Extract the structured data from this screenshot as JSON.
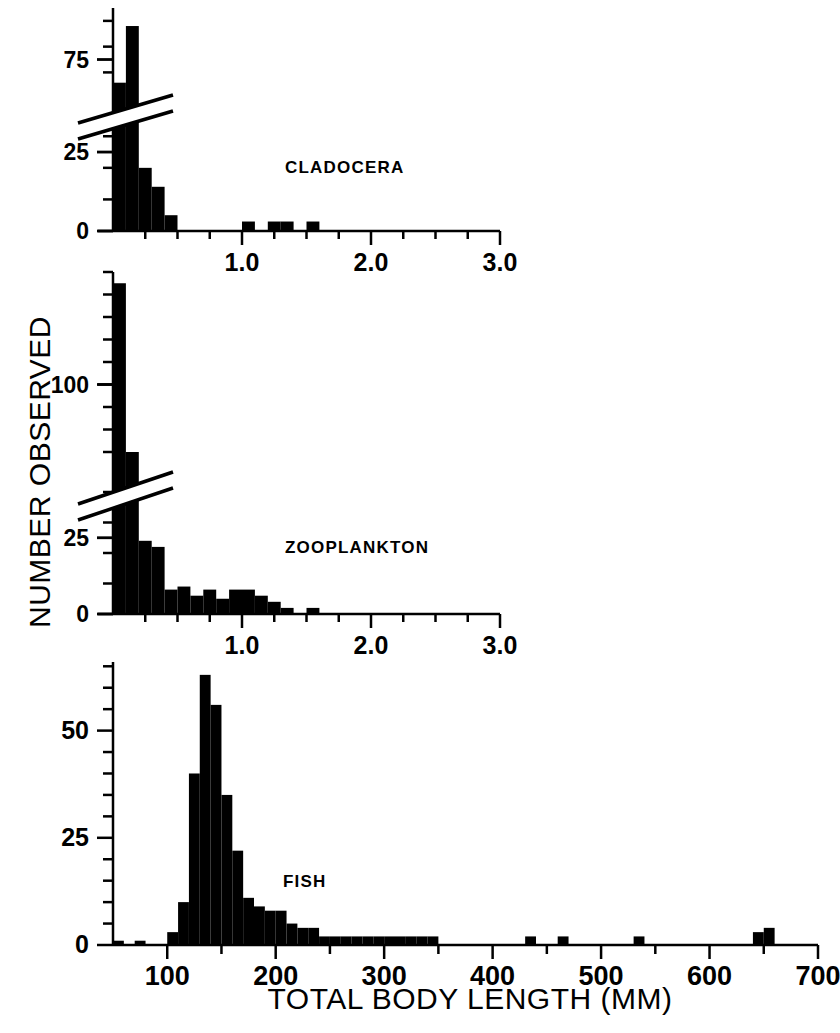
{
  "figure": {
    "axis_label_y": "NUMBER OBSERVED",
    "axis_label_x": "TOTAL BODY LENGTH (MM)",
    "ink_color": "#000000",
    "background_color": "#ffffff"
  },
  "panels": [
    {
      "id": "cladocera",
      "label": "CLADOCERA",
      "label_x": 285,
      "label_y": 158
    },
    {
      "id": "zooplankton",
      "label": "ZOOPLANKTON",
      "label_x": 285,
      "label_y": 538
    },
    {
      "id": "fish",
      "label": "FISH",
      "label_x": 283,
      "label_y": 872
    }
  ],
  "chart_data": [
    {
      "type": "bar",
      "id": "cladocera",
      "title": "CLADOCERA",
      "xlabel": "TOTAL BODY LENGTH (MM)",
      "ylabel": "NUMBER OBSERVED",
      "grid": false,
      "legend": "none",
      "axis_break": true,
      "axis_break_between": [
        38,
        62
      ],
      "xlim": [
        0.0,
        3.0
      ],
      "ylim": [
        0,
        95
      ],
      "xticks": [
        1.0,
        2.0,
        3.0
      ],
      "xtick_labels": [
        "1.0",
        "2.0",
        "3.0"
      ],
      "xminor_step": 0.25,
      "yticks": [
        0,
        25,
        75
      ],
      "ytick_labels": [
        "0",
        "25",
        "75"
      ],
      "yminor_step": 10,
      "bin_width": 0.1,
      "bins": [
        0.1,
        0.2,
        0.3,
        0.4,
        0.5,
        0.6,
        0.7,
        0.8,
        0.9,
        1.0,
        1.1,
        1.2,
        1.3,
        1.4,
        1.5,
        1.6,
        1.7,
        1.8,
        1.9,
        2.0
      ],
      "values": [
        66,
        88,
        20,
        14,
        5,
        0,
        0,
        0,
        0,
        0,
        3,
        0,
        3,
        3,
        0,
        3,
        0,
        0,
        0,
        0
      ]
    },
    {
      "type": "bar",
      "id": "zooplankton",
      "title": "ZOOPLANKTON",
      "xlabel": "TOTAL BODY LENGTH (MM)",
      "ylabel": "NUMBER OBSERVED",
      "grid": false,
      "legend": "none",
      "axis_break": true,
      "axis_break_between": [
        40,
        62
      ],
      "xlim": [
        0.0,
        3.0
      ],
      "ylim": [
        0,
        150
      ],
      "xticks": [
        1.0,
        2.0,
        3.0
      ],
      "xtick_labels": [
        "1.0",
        "2.0",
        "3.0"
      ],
      "xminor_step": 0.25,
      "yticks": [
        0,
        25,
        100
      ],
      "ytick_labels": [
        "0",
        "25",
        "100"
      ],
      "yminor_step": 10,
      "bin_width": 0.1,
      "bins": [
        0.1,
        0.2,
        0.3,
        0.4,
        0.5,
        0.6,
        0.7,
        0.8,
        0.9,
        1.0,
        1.1,
        1.2,
        1.3,
        1.4,
        1.5,
        1.6,
        1.7,
        1.8,
        1.9,
        2.0
      ],
      "values": [
        145,
        70,
        24,
        22,
        8,
        9,
        6,
        8,
        5,
        8,
        8,
        6,
        4,
        2,
        0,
        2,
        0,
        0,
        0,
        0
      ]
    },
    {
      "type": "bar",
      "id": "fish",
      "title": "FISH",
      "xlabel": "TOTAL BODY LENGTH (MM)",
      "ylabel": "NUMBER OBSERVED",
      "grid": false,
      "legend": "none",
      "axis_break": false,
      "xlim": [
        50,
        700
      ],
      "ylim": [
        0,
        66
      ],
      "xticks": [
        100,
        200,
        300,
        400,
        500,
        600,
        700
      ],
      "xtick_labels": [
        "100",
        "200",
        "300",
        "400",
        "500",
        "600",
        "700"
      ],
      "xminor_step": 50,
      "yticks": [
        0,
        25,
        50
      ],
      "ytick_labels": [
        "0",
        "25",
        "50"
      ],
      "yminor_step": 5,
      "bin_width": 10,
      "bins": [
        60,
        80,
        110,
        120,
        130,
        140,
        150,
        160,
        170,
        180,
        190,
        200,
        210,
        220,
        230,
        240,
        250,
        260,
        270,
        280,
        290,
        300,
        310,
        320,
        330,
        340,
        350,
        440,
        470,
        540,
        650,
        660
      ],
      "values": [
        1,
        1,
        3,
        10,
        40,
        63,
        56,
        35,
        22,
        11,
        9,
        8,
        8,
        5,
        4,
        4,
        2,
        2,
        2,
        2,
        2,
        2,
        2,
        2,
        2,
        2,
        2,
        2,
        2,
        2,
        3,
        4
      ]
    }
  ]
}
